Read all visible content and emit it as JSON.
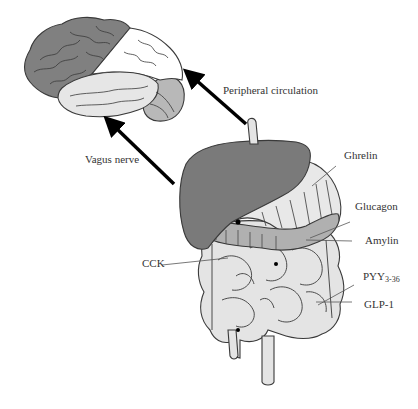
{
  "diagram": {
    "colors": {
      "frontal_lobe": "#808080",
      "parietal_lobe": "#ffffff",
      "temporal_lobe": "#e6e6e6",
      "occipital_lobe": "#b8b8b8",
      "liver": "#7a7a7a",
      "stomach": "#e8e8e8",
      "pancreas": "#b0b0b0",
      "intestine": "#e4e4e4",
      "outline": "#3a3a3a",
      "arrow": "#000000"
    },
    "pathways": [
      {
        "label": "Peripheral circulation"
      },
      {
        "label": "Vagus nerve"
      }
    ],
    "hormones": [
      {
        "label": "Ghrelin"
      },
      {
        "label": "Glucagon"
      },
      {
        "label": "Amylin"
      },
      {
        "label": "CCK"
      },
      {
        "label": "PYY",
        "subscript": "3-36"
      },
      {
        "label": "GLP-1"
      }
    ]
  }
}
